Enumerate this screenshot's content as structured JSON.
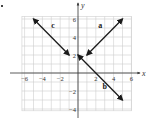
{
  "bullet": "•",
  "chart_data": {
    "type": "line",
    "title": "",
    "xlabel": "x",
    "ylabel": "y",
    "xlim": [
      -6.5,
      6.5
    ],
    "ylim": [
      -4.5,
      6.5
    ],
    "grid": true,
    "x_ticks": [
      -6,
      -4,
      -2,
      2,
      4,
      6
    ],
    "y_ticks": [
      -4,
      -2,
      2,
      4,
      6
    ],
    "x_tick_labels": [
      "−6",
      "−4",
      "−2",
      "2",
      "4",
      "6"
    ],
    "y_tick_labels": [
      "−4",
      "−2",
      "2",
      "4",
      "6"
    ],
    "series": [
      {
        "name": "a",
        "points": [
          [
            1,
            2
          ],
          [
            5,
            6
          ]
        ],
        "arrows": "both",
        "label_pos": [
          2.5,
          5
        ]
      },
      {
        "name": "b",
        "points": [
          [
            0,
            2
          ],
          [
            5,
            -3
          ]
        ],
        "arrows": "both",
        "label_pos": [
          3,
          -1.8
        ]
      },
      {
        "name": "c",
        "points": [
          [
            -5,
            6
          ],
          [
            -1,
            2
          ]
        ],
        "arrows": "both",
        "label_pos": [
          -2.8,
          5
        ]
      }
    ],
    "colors": {
      "grid": "#cfcfcf",
      "axis": "#333333",
      "line": "#1a1a1a"
    }
  }
}
